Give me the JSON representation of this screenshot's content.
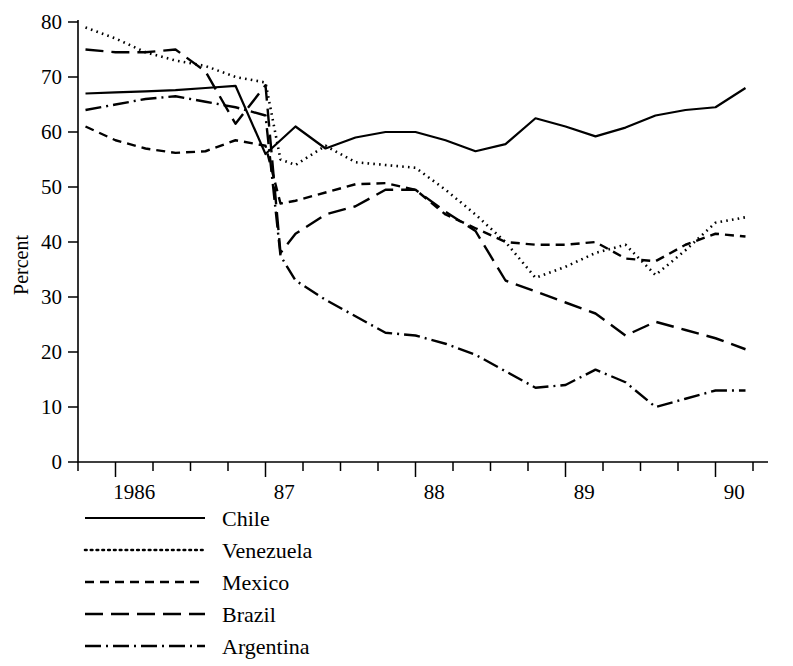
{
  "chart_data": {
    "type": "line",
    "title": "",
    "subtitle": "",
    "xlabel": "",
    "ylabel": "Percent",
    "ylim": [
      0,
      80
    ],
    "ytick_values": [
      0,
      10,
      20,
      30,
      40,
      50,
      60,
      70,
      80
    ],
    "ytick_labels": [
      "0",
      "10",
      "20",
      "30",
      "40",
      "50",
      "60",
      "70",
      "80"
    ],
    "xlim": [
      1985.75,
      1990.35
    ],
    "xtick_labels": [
      "1986",
      "87",
      "88",
      "89",
      "90"
    ],
    "xtick_values": [
      1986,
      1987,
      1988,
      1989,
      1990
    ],
    "minor_ticks_per_year": 4,
    "grid": false,
    "legend_position": "below-left",
    "x": [
      1985.8,
      1986.0,
      1986.2,
      1986.4,
      1986.6,
      1986.8,
      1987.0,
      1987.1,
      1987.2,
      1987.4,
      1987.6,
      1987.8,
      1988.0,
      1988.2,
      1988.4,
      1988.6,
      1988.8,
      1989.0,
      1989.2,
      1989.4,
      1989.6,
      1989.8,
      1990.0,
      1990.2
    ],
    "series": [
      {
        "name": "Chile",
        "style": "solid",
        "values": [
          67.0,
          67.2,
          67.4,
          67.6,
          68.0,
          68.4,
          56.0,
          58.5,
          61.0,
          57.0,
          59.0,
          60.0,
          60.0,
          58.5,
          56.5,
          57.8,
          62.5,
          61.0,
          59.2,
          60.8,
          63.0,
          64.0,
          64.5,
          68.0
        ]
      },
      {
        "name": "Venezuela",
        "style": "dotted",
        "values": [
          79.0,
          77.0,
          74.5,
          73.0,
          72.0,
          70.0,
          69.0,
          55.0,
          54.0,
          57.5,
          54.5,
          54.0,
          53.5,
          49.5,
          45.0,
          40.0,
          33.5,
          35.5,
          38.0,
          39.5,
          34.0,
          38.5,
          43.5,
          44.5
        ]
      },
      {
        "name": "Mexico",
        "style": "dashed-short",
        "values": [
          61.0,
          58.5,
          57.0,
          56.2,
          56.5,
          58.5,
          57.5,
          47.0,
          47.5,
          49.0,
          50.5,
          50.7,
          49.5,
          45.0,
          42.5,
          40.0,
          39.5,
          39.5,
          40.0,
          37.0,
          36.5,
          39.5,
          41.5,
          41.0
        ]
      },
      {
        "name": "Brazil",
        "style": "dashed-long",
        "values": [
          75.0,
          74.5,
          74.5,
          75.0,
          71.0,
          61.5,
          68.5,
          38.0,
          41.5,
          45.0,
          46.5,
          49.5,
          49.5,
          45.5,
          42.0,
          33.0,
          31.0,
          29.0,
          27.0,
          23.0,
          25.5,
          24.0,
          22.5,
          20.5
        ]
      },
      {
        "name": "Argentina",
        "style": "dash-dot",
        "values": [
          64.0,
          65.0,
          66.0,
          66.5,
          65.5,
          64.5,
          63.0,
          37.5,
          33.0,
          29.5,
          26.5,
          23.5,
          23.0,
          21.5,
          19.5,
          16.5,
          13.5,
          14.0,
          16.8,
          14.5,
          10.0,
          11.5,
          13.0,
          13.0
        ]
      }
    ]
  },
  "legend": {
    "items": [
      {
        "label": "Chile",
        "style": "solid"
      },
      {
        "label": "Venezuela",
        "style": "dotted"
      },
      {
        "label": "Mexico",
        "style": "dashed-short"
      },
      {
        "label": "Brazil",
        "style": "dashed-long"
      },
      {
        "label": "Argentina",
        "style": "dash-dot"
      }
    ]
  }
}
